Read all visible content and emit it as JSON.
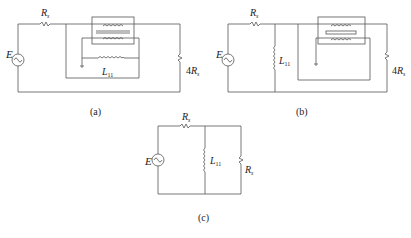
{
  "figure": {
    "panels": [
      {
        "id": "a",
        "caption": "(a)",
        "source_label": "E",
        "series_resistor": {
          "symbol": "R",
          "subscript": "s"
        },
        "load_resistor": {
          "coef": "4",
          "symbol": "R",
          "subscript": "s"
        },
        "inductor": {
          "symbol": "L",
          "subscript": "11"
        },
        "has_transformer": true
      },
      {
        "id": "b",
        "caption": "(b)",
        "source_label": "E",
        "series_resistor": {
          "symbol": "R",
          "subscript": "s"
        },
        "load_resistor": {
          "coef": "4",
          "symbol": "R",
          "subscript": "s"
        },
        "inductor": {
          "symbol": "L",
          "subscript": "11"
        },
        "has_transformer": true
      },
      {
        "id": "c",
        "caption": "(c)",
        "source_label": "E",
        "series_resistor": {
          "symbol": "R",
          "subscript": "s"
        },
        "load_resistor": {
          "coef": "",
          "symbol": "R",
          "subscript": "s"
        },
        "inductor": {
          "symbol": "L",
          "subscript": "11"
        },
        "has_transformer": false
      }
    ]
  }
}
